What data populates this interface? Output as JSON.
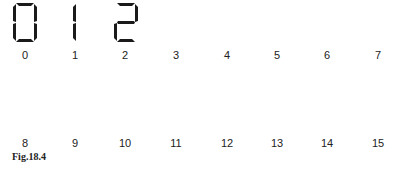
{
  "figure": {
    "caption": "Fig.18.4",
    "displayed_digits": [
      {
        "value": "0",
        "segments": [
          "a",
          "b",
          "c",
          "d",
          "e",
          "f"
        ]
      },
      {
        "value": "1",
        "segments": [
          "e",
          "f"
        ]
      },
      {
        "value": "2",
        "segments": [
          "a",
          "b",
          "g",
          "e",
          "d"
        ]
      }
    ],
    "row1_labels": [
      "0",
      "1",
      "2",
      "3",
      "4",
      "5",
      "6",
      "7"
    ],
    "row2_labels": [
      "8",
      "9",
      "10",
      "11",
      "12",
      "13",
      "14",
      "15"
    ],
    "segment_color": "#1a1a1a",
    "text_color": "#222222"
  }
}
